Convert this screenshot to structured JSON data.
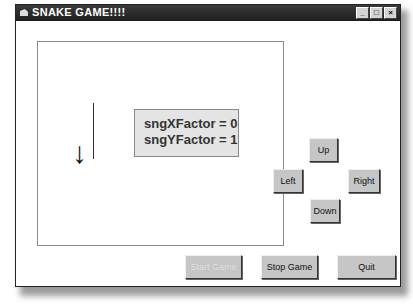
{
  "window": {
    "title": "SNAKE GAME!!!!",
    "controls": {
      "minimize": "_",
      "maximize": "□",
      "close": "×"
    }
  },
  "game_area": {
    "snake_direction_arrow": "↓",
    "info": {
      "x_factor": "sngXFactor = 0",
      "y_factor": "sngYFactor = 1"
    }
  },
  "direction_buttons": {
    "up": "Up",
    "left": "Left",
    "right": "Right",
    "down": "Down"
  },
  "actions": {
    "start": "Start Game",
    "stop": "Stop Game",
    "quit": "Quit"
  }
}
